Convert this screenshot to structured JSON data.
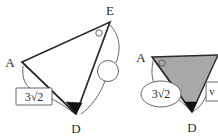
{
  "figure": {
    "background_color": "#ffffff",
    "stroke_color": "#2b2b2b",
    "shade_color": "#a8a8a8"
  },
  "left_figure": {
    "name": "triangle-ADE-unshaded",
    "vertices": [
      {
        "id": "A",
        "label": "A",
        "x": 22,
        "y": 62
      },
      {
        "id": "D",
        "label": "D",
        "x": 76,
        "y": 114
      },
      {
        "id": "E",
        "label": "E",
        "x": 110,
        "y": 22
      }
    ],
    "vertex_labels": [
      {
        "label": "A",
        "x": 10,
        "y": 62
      },
      {
        "label": "D",
        "x": 72,
        "y": 131
      },
      {
        "label": "E",
        "x": 107,
        "y": 14
      }
    ],
    "angle_markers": [
      {
        "at": "E",
        "type": "open-circle",
        "x": 99,
        "y": 33,
        "r": 3.2
      },
      {
        "at": "D",
        "type": "filled-wedge"
      },
      {
        "at": "A",
        "type": "arc"
      }
    ],
    "callout_circle": {
      "name": "empty-callout-bubble",
      "x": 108,
      "y": 71,
      "r": 10.5
    },
    "length_label": {
      "text": "3√2",
      "shape": "rectangle",
      "x": 16,
      "y": 88,
      "width": 36,
      "height": 17
    },
    "leader_curves": 3
  },
  "right_figure": {
    "name": "triangle-ADE-shaded",
    "cropped": true,
    "vertices": [
      {
        "id": "A",
        "label": "A",
        "x": 152,
        "y": 57
      },
      {
        "id": "D",
        "label": "D",
        "x": 192,
        "y": 112
      }
    ],
    "vertex_labels": [
      {
        "label": "A",
        "x": 140,
        "y": 58
      },
      {
        "label": "D",
        "x": 188,
        "y": 130
      }
    ],
    "angle_markers": [
      {
        "at": "A",
        "type": "open-circle",
        "x": 162,
        "y": 63,
        "r": 3.2
      },
      {
        "at": "D",
        "type": "filled-wedge"
      }
    ],
    "shaded_region": {
      "fill": "#a8a8a8",
      "label": "shaded-triangle"
    },
    "length_label": {
      "text": "3√2",
      "shape": "ellipse",
      "cx": 161,
      "cy": 94,
      "rx": 20,
      "ry": 13
    },
    "edge_label": {
      "text": "v",
      "shape": "rectangle",
      "x": 206,
      "y": 82,
      "width": 14,
      "height": 19,
      "clipped": true
    }
  }
}
